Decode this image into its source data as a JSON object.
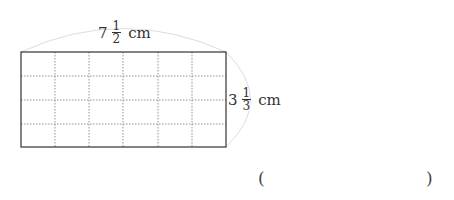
{
  "figure": {
    "type": "rectangle-grid",
    "columns": 6,
    "rows": 4,
    "width_label": {
      "whole": "7",
      "numerator": "1",
      "denominator": "2",
      "unit": "cm"
    },
    "height_label": {
      "whole": "3",
      "numerator": "1",
      "denominator": "3",
      "unit": "cm"
    }
  },
  "answer": {
    "open_paren": "(",
    "close_paren": ")",
    "value": ""
  }
}
